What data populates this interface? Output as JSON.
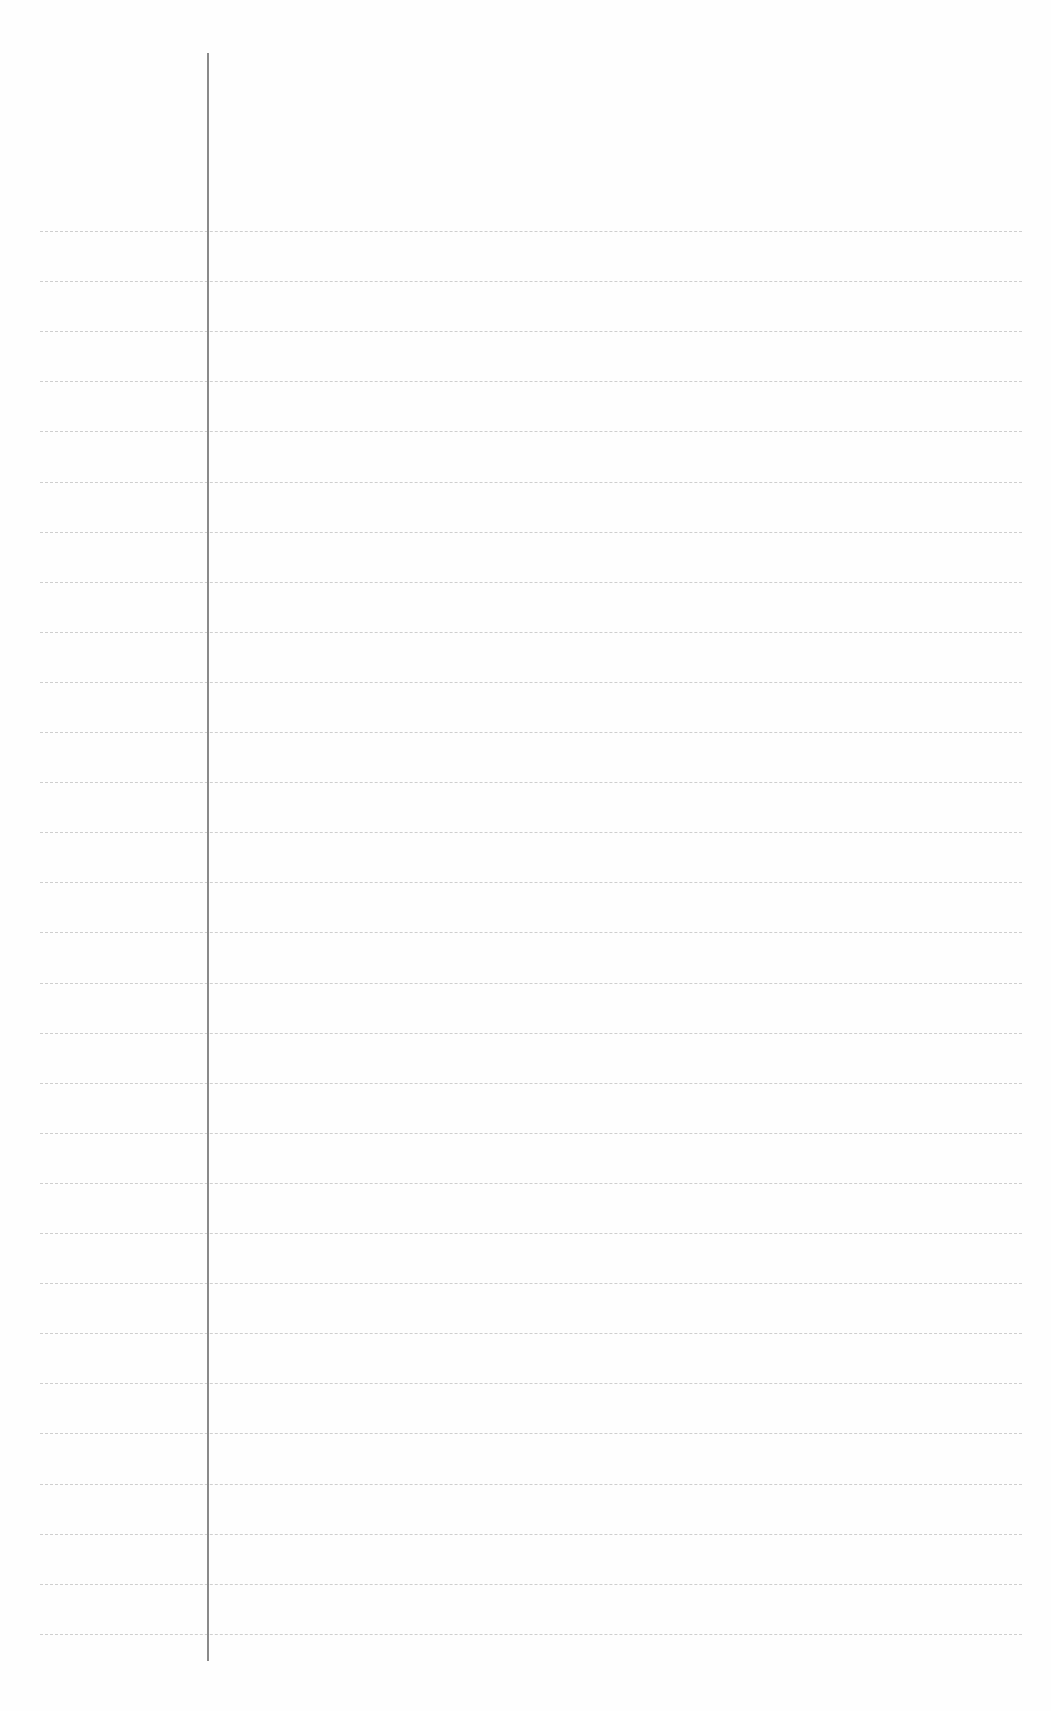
{
  "page": {
    "type": "lined-notebook-page",
    "ruled_line_count": 29,
    "first_line_y": 231,
    "line_spacing": 50.1,
    "line_color": "#cfcfcf",
    "margin_color": "#8a8a8a"
  }
}
